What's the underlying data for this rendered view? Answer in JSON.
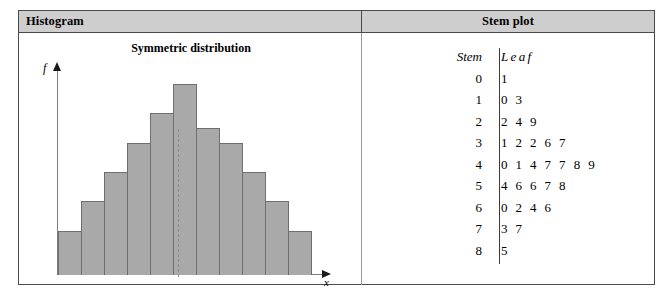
{
  "panels": {
    "histogram": {
      "header": "Histogram",
      "title": "Symmetric distribution",
      "y_axis_label": "f",
      "x_axis_label": "x"
    },
    "stemplot": {
      "header": "Stem plot",
      "column_headers": {
        "stem": "Stem",
        "leaf": "Leaf"
      },
      "rows": [
        {
          "stem": "0",
          "leaf": "1"
        },
        {
          "stem": "1",
          "leaf": "03"
        },
        {
          "stem": "2",
          "leaf": "249"
        },
        {
          "stem": "3",
          "leaf": "12267"
        },
        {
          "stem": "4",
          "leaf": "0147789"
        },
        {
          "stem": "5",
          "leaf": "46678"
        },
        {
          "stem": "6",
          "leaf": "0246"
        },
        {
          "stem": "7",
          "leaf": "37"
        },
        {
          "stem": "8",
          "leaf": "5"
        }
      ]
    }
  },
  "colors": {
    "header_band": "#cecece",
    "bar_fill": "#a9a9a9",
    "bar_stroke": "#6f6f6f",
    "frame": "#4a4a4a",
    "axis": "#7d7d7d",
    "center_line": "#8c8c8c"
  },
  "chart_data": {
    "type": "bar",
    "title": "Symmetric distribution",
    "xlabel": "x",
    "ylabel": "f",
    "grid": false,
    "legend": "none",
    "categories": [
      "1",
      "2",
      "3",
      "4",
      "5",
      "6",
      "7",
      "8",
      "9",
      "10",
      "11"
    ],
    "values": [
      3,
      5,
      7,
      9,
      11,
      13,
      10,
      9,
      7,
      5,
      3
    ],
    "ylim": [
      0,
      14
    ],
    "annotations": [
      {
        "type": "vertical-dashed-line",
        "at_category": "6",
        "note": "centre of symmetry through tallest bar"
      }
    ]
  }
}
